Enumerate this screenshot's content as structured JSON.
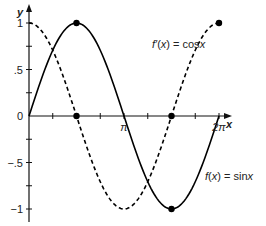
{
  "chart_data": {
    "type": "line",
    "title": "",
    "xlabel": "x",
    "ylabel": "y",
    "xlim": [
      0,
      6.2832
    ],
    "ylim": [
      -1,
      1
    ],
    "grid": false,
    "x_ticks": [
      0.7854,
      1.5708,
      2.3562,
      3.1416,
      3.927,
      4.7124,
      5.4978,
      6.2832
    ],
    "x_tick_labels": [
      {
        "value": 3.1416,
        "label": "π"
      },
      {
        "value": 6.2832,
        "label": "2π"
      }
    ],
    "y_tick_labels": [
      {
        "value": 1,
        "label": "1"
      },
      {
        "value": 0.5,
        "label": ".5"
      },
      {
        "value": 0,
        "label": "0"
      },
      {
        "value": -0.5,
        "label": "−.5"
      },
      {
        "value": -1,
        "label": "−1"
      }
    ],
    "y_ticks": [
      1,
      0.75,
      0.5,
      0.25,
      -0.25,
      -0.5,
      -0.75,
      -1
    ],
    "series": [
      {
        "name": "f(x) = sinx",
        "function": "sin",
        "style": "solid",
        "label_prefix": "f(x) = ",
        "label_fn": "sin",
        "label_var": "x",
        "marked_points": [
          [
            1.5708,
            1
          ],
          [
            4.7124,
            -1
          ]
        ]
      },
      {
        "name": "f′(x) = cosx",
        "function": "cos",
        "style": "dashed",
        "label_prefix": "f′(x) = ",
        "label_fn": "cos",
        "label_var": "x",
        "marked_points": [
          [
            1.5708,
            0
          ],
          [
            4.7124,
            0
          ],
          [
            6.2832,
            1
          ]
        ]
      }
    ]
  }
}
